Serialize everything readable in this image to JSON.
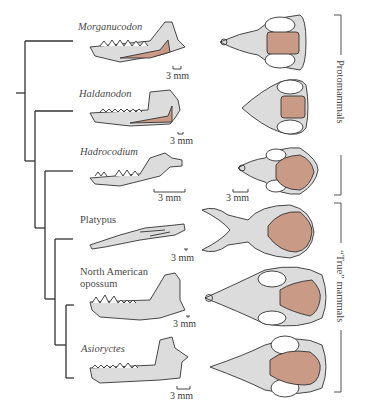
{
  "taxa": [
    {
      "name": "Morganucodon",
      "italic": true,
      "scale_jaw": "3 mm"
    },
    {
      "name": "Haldanodon",
      "italic": true,
      "scale_jaw": "3 mm"
    },
    {
      "name": "Hadrocodium",
      "italic": true,
      "scale_jaw": "3 mm",
      "scale_skull": "3 mm"
    },
    {
      "name": "Platypus",
      "italic": false,
      "scale_jaw": "3 mm"
    },
    {
      "name": "North American opossum",
      "line1": "North American",
      "line2": "opossum",
      "italic": false,
      "scale_jaw": "3 mm"
    },
    {
      "name": "Asioryctes",
      "italic": true,
      "scale_jaw": "3 mm"
    }
  ],
  "groups": [
    {
      "label": "Protomammals",
      "members": [
        "Morganucodon",
        "Haldanodon",
        "Hadrocodium"
      ]
    },
    {
      "label": "“True” mammals",
      "members": [
        "Platypus",
        "North American opossum",
        "Asioryctes"
      ]
    }
  ],
  "colors": {
    "bone": "#dcdcdc",
    "braincase": "#c99a86",
    "outline": "#333333",
    "tree": "#333333"
  }
}
